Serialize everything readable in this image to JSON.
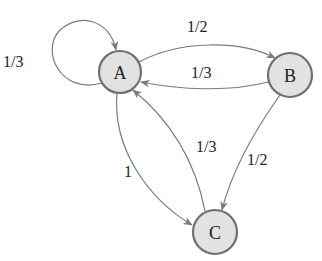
{
  "diagram": {
    "type": "markov-chain",
    "nodes": [
      {
        "id": "A",
        "label": "A"
      },
      {
        "id": "B",
        "label": "B"
      },
      {
        "id": "C",
        "label": "C"
      }
    ],
    "edges": [
      {
        "from": "A",
        "to": "A",
        "label": "1/3"
      },
      {
        "from": "A",
        "to": "B",
        "label": "1/2"
      },
      {
        "from": "B",
        "to": "A",
        "label": "1/3"
      },
      {
        "from": "B",
        "to": "C",
        "label": "1/2"
      },
      {
        "from": "C",
        "to": "A",
        "label": "1/3"
      },
      {
        "from": "A",
        "to": "C",
        "label": "1"
      }
    ],
    "colors": {
      "node_fill": "#e2e2e2",
      "node_stroke": "#6f6f6f",
      "edge": "#7a7a7a",
      "text": "#222222"
    }
  }
}
